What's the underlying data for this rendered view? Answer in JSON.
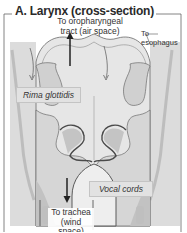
{
  "figure": {
    "title": "A. Larynx (cross-section)",
    "labels": {
      "oropharyngeal_line1": "To oropharyngeal",
      "oropharyngeal_line2": "tract (air space)",
      "esophagus_line1": "To",
      "esophagus_line2": "esophagus",
      "rima_glottidis": "Rima glottidis",
      "vocal_cords": "Vocal cords",
      "trachea_line1": "To trachea",
      "trachea_line2": "(wind space)"
    },
    "colors": {
      "frame": "#555555",
      "tissue_light": "#e4e4e4",
      "tissue_mid": "#c8c8c8",
      "tissue_dark": "#a8a8a8",
      "outline": "#5a5a5a",
      "label_box": "#e2e2e2"
    }
  }
}
